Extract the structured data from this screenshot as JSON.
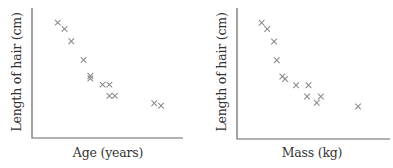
{
  "chart_data": [
    {
      "type": "scatter",
      "title": "",
      "xlabel": "Age (years)",
      "ylabel": "Length of hair (cm)",
      "grid": false,
      "ticks": false,
      "marker": "x",
      "marker_color": "#8c8c8c",
      "axis_color": "#666666",
      "trend": "negative correlation",
      "xlim": [
        0,
        10
      ],
      "ylim": [
        0,
        10
      ],
      "points": [
        {
          "x": 1.6,
          "y": 9.3
        },
        {
          "x": 2.1,
          "y": 8.8
        },
        {
          "x": 2.6,
          "y": 7.8
        },
        {
          "x": 3.5,
          "y": 6.3
        },
        {
          "x": 4.0,
          "y": 5.0
        },
        {
          "x": 4.0,
          "y": 4.8
        },
        {
          "x": 4.9,
          "y": 4.3
        },
        {
          "x": 5.4,
          "y": 4.3
        },
        {
          "x": 5.4,
          "y": 3.4
        },
        {
          "x": 5.8,
          "y": 3.4
        },
        {
          "x": 8.7,
          "y": 2.8
        },
        {
          "x": 9.2,
          "y": 2.6
        }
      ]
    },
    {
      "type": "scatter",
      "title": "",
      "xlabel": "Mass (kg)",
      "ylabel": "Length of hair (cm)",
      "grid": false,
      "ticks": false,
      "marker": "x",
      "marker_color": "#8c8c8c",
      "axis_color": "#666666",
      "trend": "negative correlation",
      "xlim": [
        0,
        10
      ],
      "ylim": [
        0,
        10
      ],
      "points": [
        {
          "x": 1.5,
          "y": 9.3
        },
        {
          "x": 1.9,
          "y": 8.8
        },
        {
          "x": 2.4,
          "y": 7.8
        },
        {
          "x": 2.6,
          "y": 6.3
        },
        {
          "x": 3.0,
          "y": 5.0
        },
        {
          "x": 3.2,
          "y": 4.8
        },
        {
          "x": 4.0,
          "y": 4.3
        },
        {
          "x": 4.9,
          "y": 4.3
        },
        {
          "x": 4.8,
          "y": 3.4
        },
        {
          "x": 5.8,
          "y": 3.4
        },
        {
          "x": 5.5,
          "y": 2.9
        },
        {
          "x": 8.5,
          "y": 2.6
        }
      ]
    }
  ]
}
